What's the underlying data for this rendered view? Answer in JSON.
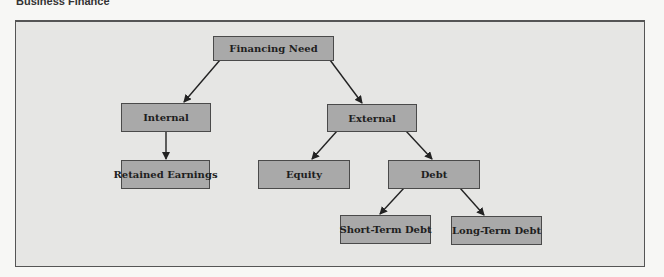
{
  "header": {
    "title": "Business Finance"
  },
  "diagram": {
    "type": "tree",
    "colors": {
      "node_fill": "#a9a9a9",
      "node_border": "#4a4a4a",
      "background": "#e6e6e4",
      "arrow": "#222222"
    },
    "nodes": {
      "financing_need": {
        "label": "Financing Need"
      },
      "internal": {
        "label": "Internal"
      },
      "external": {
        "label": "External"
      },
      "retained_earnings": {
        "label": "Retained Earnings"
      },
      "equity": {
        "label": "Equity"
      },
      "debt": {
        "label": "Debt"
      },
      "short_term_debt": {
        "label": "Short-Term Debt"
      },
      "long_term_debt": {
        "label": "Long-Term Debt"
      }
    },
    "edges": [
      [
        "Financing Need",
        "Internal"
      ],
      [
        "Financing Need",
        "External"
      ],
      [
        "Internal",
        "Retained Earnings"
      ],
      [
        "External",
        "Equity"
      ],
      [
        "External",
        "Debt"
      ],
      [
        "Debt",
        "Short-Term Debt"
      ],
      [
        "Debt",
        "Long-Term Debt"
      ]
    ]
  }
}
